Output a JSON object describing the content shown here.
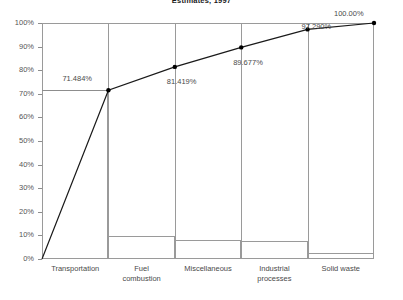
{
  "chart_data": {
    "type": "bar",
    "title": "Estimates, 1997",
    "xlabel": "",
    "ylabel": "",
    "ylim": [
      0,
      100
    ],
    "grid": false,
    "legend": false,
    "categories": [
      "Transportation",
      "Fuel combustion",
      "Miscellaneous",
      "Industrial processes",
      "Solid waste"
    ],
    "series": [
      {
        "name": "Share",
        "type": "bar",
        "values": [
          71.484,
          9.935,
          8.258,
          7.613,
          2.71
        ]
      },
      {
        "name": "Cumulative",
        "type": "line",
        "values": [
          71.484,
          81.419,
          89.677,
          97.29,
          100.0
        ],
        "point_labels": [
          "71.484%",
          "81.419%",
          "89.677%",
          "97.290%",
          "100.00%"
        ]
      }
    ],
    "y_ticks": [
      "0%",
      "10%",
      "20%",
      "30%",
      "40%",
      "50%",
      "60%",
      "70%",
      "80%",
      "90%",
      "100%"
    ],
    "x_tick_lines": [
      [
        "Transportation"
      ],
      [
        "Fuel",
        "combustion"
      ],
      [
        "Miscellaneous"
      ],
      [
        "Industrial",
        "processes"
      ],
      [
        "Solid waste"
      ]
    ],
    "colors": {
      "line": "#1a1a1a",
      "marker": "#000000",
      "bar_border": "#9a9a9a",
      "frame": "#9a9a9a",
      "text": "#4a4a4a"
    }
  }
}
